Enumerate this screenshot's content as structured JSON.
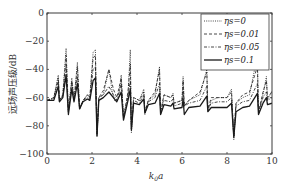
{
  "chart_data": {
    "type": "line",
    "title": "",
    "xlabel": "k0a",
    "xlabel_display": {
      "base": "k",
      "sub": "0",
      "rest": "a"
    },
    "ylabel": "远场声压级/dB",
    "xlim": [
      0,
      10
    ],
    "ylim": [
      -100,
      0
    ],
    "xticks": [
      0,
      2,
      4,
      6,
      8,
      10
    ],
    "yticks": [
      0,
      -20,
      -40,
      -60,
      -80,
      -100
    ],
    "grid": false,
    "legend_position": "upper right",
    "legend": [
      "ηs=0",
      "ηs=0.01",
      "ηs=0.05",
      "ηs=0.1"
    ],
    "series": [
      {
        "name": "ηs=0",
        "style": "dotted",
        "points": [
          [
            0,
            -62
          ],
          [
            0.3,
            -60
          ],
          [
            0.5,
            -44
          ],
          [
            0.55,
            -62
          ],
          [
            0.7,
            -58
          ],
          [
            0.85,
            -25
          ],
          [
            0.95,
            -70
          ],
          [
            1.1,
            -46
          ],
          [
            1.2,
            -62
          ],
          [
            1.35,
            -35
          ],
          [
            1.45,
            -68
          ],
          [
            1.6,
            -62
          ],
          [
            1.8,
            -58
          ],
          [
            1.9,
            -60
          ],
          [
            2.05,
            -28
          ],
          [
            2.15,
            -26
          ],
          [
            2.22,
            -88
          ],
          [
            2.3,
            -60
          ],
          [
            2.5,
            -58
          ],
          [
            2.75,
            -40
          ],
          [
            2.9,
            -56
          ],
          [
            3.0,
            -62
          ],
          [
            3.2,
            -60
          ],
          [
            3.3,
            -44
          ],
          [
            3.4,
            -75
          ],
          [
            3.6,
            -58
          ],
          [
            3.7,
            -26
          ],
          [
            3.75,
            -85
          ],
          [
            3.85,
            -60
          ],
          [
            4.1,
            -62
          ],
          [
            4.3,
            -54
          ],
          [
            4.35,
            -72
          ],
          [
            4.5,
            -62
          ],
          [
            4.8,
            -58
          ],
          [
            5.0,
            -38
          ],
          [
            5.05,
            -72
          ],
          [
            5.2,
            -58
          ],
          [
            5.5,
            -60
          ],
          [
            5.6,
            -57
          ],
          [
            5.65,
            -64
          ],
          [
            6.0,
            -62
          ],
          [
            6.05,
            -45
          ],
          [
            6.1,
            -66
          ],
          [
            6.3,
            -62
          ],
          [
            6.8,
            -58
          ],
          [
            7.1,
            -40
          ],
          [
            7.15,
            -70
          ],
          [
            7.3,
            -62
          ],
          [
            7.6,
            -60
          ],
          [
            8.0,
            -60
          ],
          [
            8.2,
            -54
          ],
          [
            8.3,
            -90
          ],
          [
            8.4,
            -64
          ],
          [
            8.7,
            -60
          ],
          [
            9.0,
            -58
          ],
          [
            9.35,
            -30
          ],
          [
            9.4,
            -72
          ],
          [
            9.6,
            -58
          ],
          [
            9.75,
            -45
          ],
          [
            9.8,
            -62
          ],
          [
            10,
            -55
          ]
        ]
      },
      {
        "name": "ηs=0.01",
        "style": "dashed",
        "points": [
          [
            0,
            -62
          ],
          [
            0.3,
            -60
          ],
          [
            0.5,
            -46
          ],
          [
            0.55,
            -62
          ],
          [
            0.7,
            -58
          ],
          [
            0.85,
            -30
          ],
          [
            0.95,
            -70
          ],
          [
            1.1,
            -48
          ],
          [
            1.2,
            -62
          ],
          [
            1.35,
            -38
          ],
          [
            1.45,
            -68
          ],
          [
            1.6,
            -62
          ],
          [
            1.8,
            -58
          ],
          [
            1.9,
            -60
          ],
          [
            2.05,
            -32
          ],
          [
            2.15,
            -30
          ],
          [
            2.22,
            -86
          ],
          [
            2.3,
            -60
          ],
          [
            2.5,
            -55
          ],
          [
            2.75,
            -40
          ],
          [
            2.95,
            -54
          ],
          [
            3.1,
            -60
          ],
          [
            3.3,
            -46
          ],
          [
            3.4,
            -74
          ],
          [
            3.6,
            -56
          ],
          [
            3.7,
            -36
          ],
          [
            3.75,
            -83
          ],
          [
            3.85,
            -60
          ],
          [
            4.1,
            -62
          ],
          [
            4.3,
            -56
          ],
          [
            4.35,
            -70
          ],
          [
            4.5,
            -62
          ],
          [
            4.8,
            -56
          ],
          [
            5.0,
            -40
          ],
          [
            5.05,
            -70
          ],
          [
            5.2,
            -58
          ],
          [
            5.5,
            -60
          ],
          [
            5.6,
            -58
          ],
          [
            5.65,
            -64
          ],
          [
            6.0,
            -62
          ],
          [
            6.05,
            -48
          ],
          [
            6.1,
            -66
          ],
          [
            6.3,
            -62
          ],
          [
            6.8,
            -56
          ],
          [
            7.1,
            -42
          ],
          [
            7.15,
            -68
          ],
          [
            7.3,
            -60
          ],
          [
            7.6,
            -60
          ],
          [
            8.0,
            -60
          ],
          [
            8.2,
            -56
          ],
          [
            8.3,
            -88
          ],
          [
            8.4,
            -64
          ],
          [
            8.7,
            -58
          ],
          [
            9.0,
            -56
          ],
          [
            9.35,
            -38
          ],
          [
            9.4,
            -70
          ],
          [
            9.6,
            -56
          ],
          [
            9.75,
            -48
          ],
          [
            9.8,
            -60
          ],
          [
            10,
            -56
          ]
        ]
      },
      {
        "name": "ηs=0.05",
        "style": "dashdot",
        "points": [
          [
            0,
            -62
          ],
          [
            0.3,
            -61
          ],
          [
            0.5,
            -48
          ],
          [
            0.55,
            -62
          ],
          [
            0.7,
            -59
          ],
          [
            0.85,
            -38
          ],
          [
            0.95,
            -70
          ],
          [
            1.1,
            -50
          ],
          [
            1.2,
            -62
          ],
          [
            1.35,
            -45
          ],
          [
            1.45,
            -68
          ],
          [
            1.6,
            -62
          ],
          [
            1.8,
            -60
          ],
          [
            1.9,
            -61
          ],
          [
            2.05,
            -40
          ],
          [
            2.15,
            -38
          ],
          [
            2.22,
            -86
          ],
          [
            2.3,
            -60
          ],
          [
            2.5,
            -58
          ],
          [
            2.75,
            -52
          ],
          [
            2.95,
            -58
          ],
          [
            3.1,
            -62
          ],
          [
            3.3,
            -50
          ],
          [
            3.4,
            -74
          ],
          [
            3.6,
            -60
          ],
          [
            3.7,
            -48
          ],
          [
            3.75,
            -82
          ],
          [
            3.85,
            -62
          ],
          [
            4.1,
            -64
          ],
          [
            4.3,
            -58
          ],
          [
            4.35,
            -70
          ],
          [
            4.5,
            -63
          ],
          [
            4.8,
            -60
          ],
          [
            5.0,
            -50
          ],
          [
            5.05,
            -70
          ],
          [
            5.2,
            -62
          ],
          [
            5.5,
            -63
          ],
          [
            5.6,
            -61
          ],
          [
            5.65,
            -66
          ],
          [
            6.0,
            -64
          ],
          [
            6.05,
            -55
          ],
          [
            6.1,
            -66
          ],
          [
            6.3,
            -64
          ],
          [
            6.8,
            -62
          ],
          [
            7.1,
            -52
          ],
          [
            7.15,
            -68
          ],
          [
            7.3,
            -64
          ],
          [
            7.6,
            -63
          ],
          [
            8.0,
            -63
          ],
          [
            8.2,
            -60
          ],
          [
            8.3,
            -87
          ],
          [
            8.4,
            -66
          ],
          [
            8.7,
            -63
          ],
          [
            9.0,
            -62
          ],
          [
            9.35,
            -50
          ],
          [
            9.4,
            -70
          ],
          [
            9.6,
            -60
          ],
          [
            9.75,
            -56
          ],
          [
            9.8,
            -62
          ],
          [
            10,
            -60
          ]
        ]
      },
      {
        "name": "ηs=0.1",
        "style": "solid",
        "points": [
          [
            0,
            -62
          ],
          [
            0.3,
            -62
          ],
          [
            0.5,
            -52
          ],
          [
            0.55,
            -63
          ],
          [
            0.7,
            -60
          ],
          [
            0.85,
            -44
          ],
          [
            0.95,
            -72
          ],
          [
            1.1,
            -54
          ],
          [
            1.2,
            -63
          ],
          [
            1.35,
            -50
          ],
          [
            1.45,
            -68
          ],
          [
            1.6,
            -63
          ],
          [
            1.8,
            -61
          ],
          [
            1.9,
            -62
          ],
          [
            2.05,
            -48
          ],
          [
            2.15,
            -46
          ],
          [
            2.22,
            -87
          ],
          [
            2.3,
            -62
          ],
          [
            2.5,
            -60
          ],
          [
            2.75,
            -56
          ],
          [
            2.95,
            -60
          ],
          [
            3.1,
            -63
          ],
          [
            3.3,
            -56
          ],
          [
            3.4,
            -76
          ],
          [
            3.6,
            -62
          ],
          [
            3.7,
            -54
          ],
          [
            3.75,
            -83
          ],
          [
            3.85,
            -64
          ],
          [
            4.1,
            -65
          ],
          [
            4.3,
            -61
          ],
          [
            4.35,
            -71
          ],
          [
            4.5,
            -65
          ],
          [
            4.8,
            -64
          ],
          [
            5.0,
            -57
          ],
          [
            5.05,
            -72
          ],
          [
            5.2,
            -65
          ],
          [
            5.5,
            -66
          ],
          [
            5.6,
            -64
          ],
          [
            5.65,
            -68
          ],
          [
            6.0,
            -67
          ],
          [
            6.05,
            -61
          ],
          [
            6.1,
            -72
          ],
          [
            6.3,
            -67
          ],
          [
            6.8,
            -66
          ],
          [
            7.1,
            -59
          ],
          [
            7.15,
            -70
          ],
          [
            7.3,
            -67
          ],
          [
            7.6,
            -67
          ],
          [
            8.0,
            -67
          ],
          [
            8.2,
            -64
          ],
          [
            8.3,
            -88
          ],
          [
            8.4,
            -70
          ],
          [
            8.7,
            -67
          ],
          [
            9.0,
            -66
          ],
          [
            9.35,
            -57
          ],
          [
            9.4,
            -72
          ],
          [
            9.6,
            -64
          ],
          [
            9.75,
            -60
          ],
          [
            9.8,
            -65
          ],
          [
            10,
            -64
          ]
        ]
      }
    ]
  },
  "colors": {
    "axis": "#3a3a3a",
    "line": "#1a1a1a"
  }
}
